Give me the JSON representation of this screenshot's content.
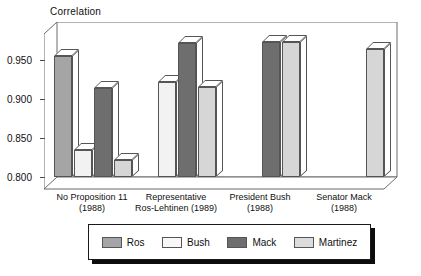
{
  "chart_data": {
    "type": "bar",
    "title": "",
    "ylabel": "Correlation",
    "xlabel": "",
    "ylim": [
      0.8,
      0.98
    ],
    "yticks": [
      "0.800",
      "0.850",
      "0.900",
      "0.950"
    ],
    "ytick_values": [
      0.8,
      0.85,
      0.9,
      0.95
    ],
    "grid": false,
    "legend_position": "bottom",
    "style": "3d-grouped-bars",
    "categories": [
      "No Proposition 11\n(1988)",
      "Representative\nRos-Lehtinen (1989)",
      "President Bush\n(1988)",
      "Senator Mack\n(1988)"
    ],
    "category_lines": [
      {
        "line1": "No Proposition 11",
        "line2": "(1988)"
      },
      {
        "line1": "Representative",
        "line2": "Ros-Lehtinen (1989)"
      },
      {
        "line1": "President Bush",
        "line2": "(1988)"
      },
      {
        "line1": "Senator Mack",
        "line2": "(1988)"
      }
    ],
    "series": [
      {
        "name": "Ros",
        "color": "#a5a5a5",
        "values": [
          0.955,
          null,
          null,
          null
        ]
      },
      {
        "name": "Bush",
        "color": "#f2f2f2",
        "values": [
          0.835,
          0.922,
          null,
          null
        ]
      },
      {
        "name": "Mack",
        "color": "#6e6e6e",
        "values": [
          0.915,
          0.972,
          0.973,
          null
        ]
      },
      {
        "name": "Martinez",
        "color": "#d6d6d6",
        "values": [
          0.822,
          0.916,
          0.974,
          0.965
        ]
      }
    ]
  },
  "legend": {
    "items": [
      {
        "label": "Ros"
      },
      {
        "label": "Bush"
      },
      {
        "label": "Mack"
      },
      {
        "label": "Martinez"
      }
    ]
  }
}
